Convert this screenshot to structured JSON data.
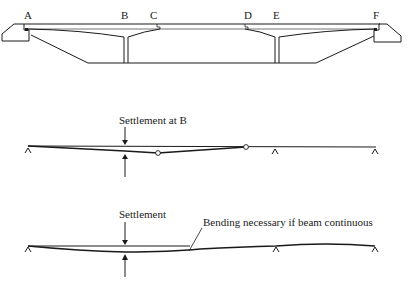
{
  "bridge": {
    "labels": {
      "A": "A",
      "B": "B",
      "C": "C",
      "D": "D",
      "E": "E",
      "F": "F"
    }
  },
  "diagram_settlement_hinged": {
    "caption": "Settlement at B"
  },
  "diagram_settlement_continuous": {
    "caption": "Settlement",
    "annotation": "Bending necessary if beam continuous"
  }
}
